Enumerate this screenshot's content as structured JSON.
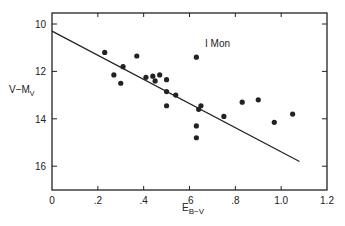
{
  "chart_data": {
    "type": "scatter",
    "title": "",
    "annotation": "I Mon",
    "xlabel": "E",
    "xlabel_sub": "B−V",
    "ylabel": "V−M",
    "ylabel_sub": "V",
    "xlim": [
      0,
      1.2
    ],
    "ylim": [
      10,
      16
    ],
    "y_inverted": true,
    "grid": false,
    "x_ticks": [
      0,
      0.2,
      0.4,
      0.6,
      0.8,
      1.0,
      1.2
    ],
    "x_tick_labels": [
      "0",
      ".2",
      ".4",
      ".6",
      ".8",
      "1.0",
      "1.2"
    ],
    "y_ticks": [
      10,
      12,
      14,
      16
    ],
    "y_tick_labels": [
      "10",
      "12",
      "14",
      "16"
    ],
    "series": [
      {
        "name": "stars",
        "marker": "circle",
        "color": "#222222",
        "points": [
          {
            "x": 0.23,
            "y": 11.2
          },
          {
            "x": 0.27,
            "y": 12.15
          },
          {
            "x": 0.3,
            "y": 12.5
          },
          {
            "x": 0.31,
            "y": 11.8
          },
          {
            "x": 0.37,
            "y": 11.35
          },
          {
            "x": 0.41,
            "y": 12.25
          },
          {
            "x": 0.44,
            "y": 12.2
          },
          {
            "x": 0.45,
            "y": 12.4
          },
          {
            "x": 0.47,
            "y": 12.15
          },
          {
            "x": 0.5,
            "y": 12.35
          },
          {
            "x": 0.5,
            "y": 12.85
          },
          {
            "x": 0.5,
            "y": 13.45
          },
          {
            "x": 0.54,
            "y": 13.0
          },
          {
            "x": 0.63,
            "y": 11.4
          },
          {
            "x": 0.65,
            "y": 13.45
          },
          {
            "x": 0.64,
            "y": 13.6
          },
          {
            "x": 0.63,
            "y": 14.3
          },
          {
            "x": 0.63,
            "y": 14.8
          },
          {
            "x": 0.75,
            "y": 13.9
          },
          {
            "x": 0.83,
            "y": 13.3
          },
          {
            "x": 0.9,
            "y": 13.2
          },
          {
            "x": 0.97,
            "y": 14.15
          },
          {
            "x": 1.05,
            "y": 13.8
          }
        ]
      }
    ],
    "fit_line": {
      "x0": 0,
      "y0": 10.3,
      "x1": 1.08,
      "y1": 15.8
    }
  }
}
